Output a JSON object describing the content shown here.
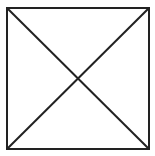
{
  "diagram": {
    "type": "square-with-diagonals",
    "stroke_color": "#222222",
    "background": "#ffffff",
    "square": {
      "x": 7,
      "y": 8,
      "width": 142,
      "height": 141,
      "stroke_width": 2
    },
    "diagonals": [
      {
        "name": "diagonal-top-left-to-bottom-right",
        "x1": 7,
        "y1": 8,
        "x2": 149,
        "y2": 149
      },
      {
        "name": "diagonal-top-right-to-bottom-left",
        "x1": 149,
        "y1": 8,
        "x2": 7,
        "y2": 149
      }
    ],
    "intersection": {
      "x": 78,
      "y": 78
    }
  }
}
